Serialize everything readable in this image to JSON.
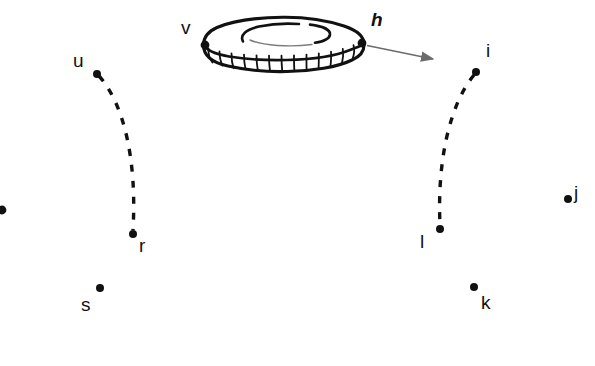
{
  "figure": {
    "background_color": "#ffffff",
    "stroke_color": "#111111",
    "arrow_color": "#6b6b6b",
    "width": 595,
    "height": 366
  },
  "shape": {
    "name": "torus",
    "style": "hand-drawn outline with hatched front band",
    "outer_center_x": 285,
    "outer_center_y": 44,
    "outer_rx": 82,
    "outer_ry": 24,
    "inner_rx": 41,
    "inner_ry": 11,
    "band_depth": 18,
    "hatch_count": 13
  },
  "labels": [
    {
      "id": "v",
      "text": "v",
      "x": 181,
      "y": 18,
      "italic": false
    },
    {
      "id": "h",
      "text": "h",
      "x": 371,
      "y": 10,
      "italic": true
    },
    {
      "id": "u",
      "text": "u",
      "x": 73,
      "y": 51,
      "italic": false
    },
    {
      "id": "i",
      "text": "i",
      "x": 486,
      "y": 41,
      "italic": false
    },
    {
      "id": "r",
      "text": "r",
      "x": 139,
      "y": 236,
      "italic": false
    },
    {
      "id": "l",
      "text": "l",
      "x": 420,
      "y": 232,
      "italic": false
    },
    {
      "id": "j",
      "text": "j",
      "x": 574,
      "y": 183,
      "italic": false
    },
    {
      "id": "s",
      "text": "s",
      "x": 81,
      "y": 295,
      "italic": false
    },
    {
      "id": "k",
      "text": "k",
      "x": 481,
      "y": 293,
      "italic": false
    }
  ],
  "points": [
    {
      "id": "v",
      "label": "v",
      "x": 205,
      "y": 45,
      "r": 4.2
    },
    {
      "id": "h",
      "label": "h",
      "x": 362,
      "y": 43,
      "r": 4.2
    },
    {
      "id": "u",
      "label": "u",
      "x": 97,
      "y": 74,
      "r": 4.0
    },
    {
      "id": "i",
      "label": "i",
      "x": 476,
      "y": 72,
      "r": 4.0
    },
    {
      "id": "r",
      "label": "r",
      "x": 133,
      "y": 234,
      "r": 4.0
    },
    {
      "id": "l",
      "label": "l",
      "x": 440,
      "y": 229,
      "r": 4.0
    },
    {
      "id": "j",
      "label": "j",
      "x": 568,
      "y": 199,
      "r": 4.0
    },
    {
      "id": "s",
      "label": "s",
      "x": 100,
      "y": 288,
      "r": 4.0
    },
    {
      "id": "k",
      "label": "k",
      "x": 474,
      "y": 287,
      "r": 4.0
    },
    {
      "id": "edge",
      "label": "",
      "x": 2,
      "y": 210,
      "r": 4.0
    }
  ],
  "dashed_arcs": [
    {
      "id": "arc-u-r",
      "from": "u",
      "to": "r",
      "path": "M 99 76 C 124 104 137 160 133 230",
      "dash": "7 9",
      "width": 3.4
    },
    {
      "id": "arc-i-l",
      "from": "i",
      "to": "l",
      "path": "M 474 75 C 450 104 437 160 440 225",
      "dash": "7 9",
      "width": 3.4
    }
  ],
  "arrow": {
    "id": "arrow-h",
    "from_x": 366,
    "from_y": 45,
    "to_x": 441,
    "to_y": 61,
    "color": "#6b6b6b",
    "width": 1.4
  }
}
